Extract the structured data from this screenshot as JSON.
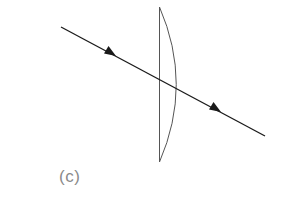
{
  "figure": {
    "label": "(c)",
    "colors": {
      "ray": "#1a1a1a",
      "lens": "#555555",
      "label": "#8a8a8a",
      "background": "#ffffff"
    },
    "ray": {
      "start": [
        61,
        27
      ],
      "end": [
        265,
        136
      ],
      "arrows": [
        {
          "tip": [
            116,
            56
          ],
          "direction": "down-right"
        },
        {
          "tip": [
            221,
            112
          ],
          "direction": "down-right"
        }
      ]
    },
    "lens": {
      "type": "plano-convex",
      "flat_side_x": 159,
      "top": [
        159,
        7
      ],
      "bottom": [
        159,
        162
      ],
      "bulge_x": 176
    }
  }
}
